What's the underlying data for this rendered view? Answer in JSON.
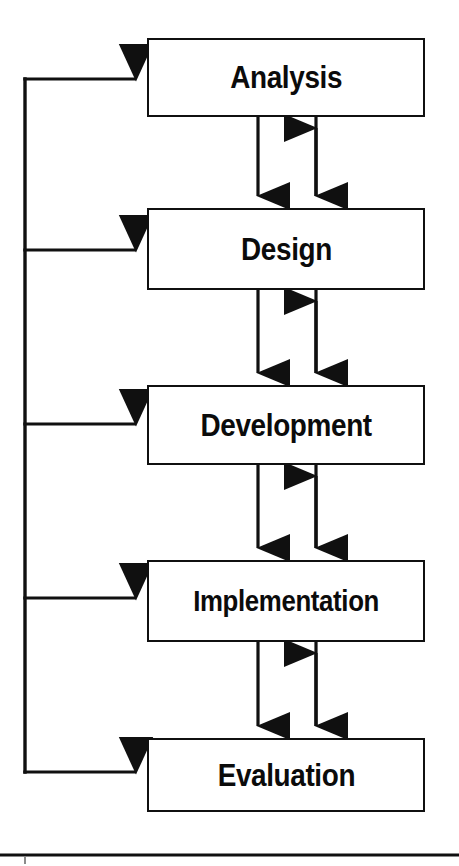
{
  "diagram": {
    "type": "flowchart",
    "orientation": "vertical",
    "background_color": "#ffffff",
    "line_color": "#101010",
    "text_color": "#0b0b0b",
    "stages": [
      {
        "id": "analysis",
        "label": "Analysis",
        "order": 1
      },
      {
        "id": "design",
        "label": "Design",
        "order": 2
      },
      {
        "id": "development",
        "label": "Development",
        "order": 3
      },
      {
        "id": "implementation",
        "label": "Implementation",
        "order": 4
      },
      {
        "id": "evaluation",
        "label": "Evaluation",
        "order": 5
      }
    ],
    "connectors": {
      "forward_flow": [
        {
          "from": "analysis",
          "to": "design",
          "arrow": "single-down"
        },
        {
          "from": "design",
          "to": "development",
          "arrow": "single-down"
        },
        {
          "from": "development",
          "to": "implementation",
          "arrow": "single-down"
        },
        {
          "from": "implementation",
          "to": "evaluation",
          "arrow": "single-down"
        }
      ],
      "bidirectional": [
        {
          "between": [
            "analysis",
            "design"
          ],
          "arrow": "double-headed"
        },
        {
          "between": [
            "design",
            "development"
          ],
          "arrow": "double-headed"
        },
        {
          "between": [
            "development",
            "implementation"
          ],
          "arrow": "double-headed"
        },
        {
          "between": [
            "implementation",
            "evaluation"
          ],
          "arrow": "double-headed"
        }
      ],
      "feedback": {
        "source": "evaluation",
        "spine_label": "",
        "targets": [
          "analysis",
          "design",
          "development",
          "implementation",
          "evaluation"
        ],
        "arrow": "single-right"
      }
    },
    "footer_rule": {
      "visible": true,
      "tick_mark": true
    }
  }
}
